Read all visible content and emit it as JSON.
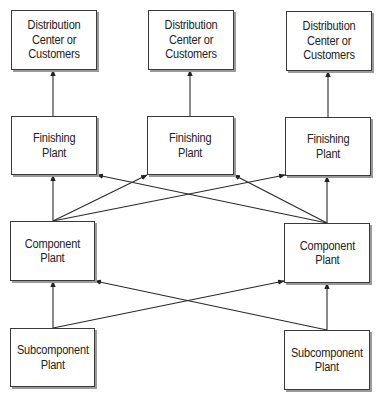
{
  "diagram": {
    "type": "supply-chain-network",
    "nodes": [
      {
        "id": "dc1",
        "label": "Distribution\nCenter or\nCustomers",
        "x": 11,
        "y": 10,
        "w": 86,
        "h": 60
      },
      {
        "id": "dc2",
        "label": "Distribution\nCenter or\nCustomers",
        "x": 148,
        "y": 10,
        "w": 86,
        "h": 60
      },
      {
        "id": "dc3",
        "label": "Distribution\nCenter or\nCustomers",
        "x": 286,
        "y": 11,
        "w": 86,
        "h": 60
      },
      {
        "id": "fp1",
        "label": "Finishing\nPlant",
        "x": 11,
        "y": 116,
        "w": 86,
        "h": 59
      },
      {
        "id": "fp2",
        "label": "Finishing\nPlant",
        "x": 147,
        "y": 116,
        "w": 87,
        "h": 59
      },
      {
        "id": "fp3",
        "label": "Finishing\nPlant",
        "x": 285,
        "y": 117,
        "w": 86,
        "h": 59
      },
      {
        "id": "cp1",
        "label": "Component\nPlant",
        "x": 10,
        "y": 221,
        "w": 85,
        "h": 60
      },
      {
        "id": "cp2",
        "label": "Component\nPlant",
        "x": 284,
        "y": 223,
        "w": 86,
        "h": 60
      },
      {
        "id": "sp1",
        "label": "Subcomponent\nPlant",
        "x": 10,
        "y": 328,
        "w": 85,
        "h": 59
      },
      {
        "id": "sp2",
        "label": "Subcomponent\nPlant",
        "x": 284,
        "y": 330,
        "w": 86,
        "h": 60
      }
    ],
    "edges": [
      {
        "from": "fp1",
        "to": "dc1",
        "x1": 53,
        "y1": 116,
        "x2": 53,
        "y2": 70
      },
      {
        "from": "fp2",
        "to": "dc2",
        "x1": 190,
        "y1": 116,
        "x2": 190,
        "y2": 70
      },
      {
        "from": "fp3",
        "to": "dc3",
        "x1": 328,
        "y1": 117,
        "x2": 328,
        "y2": 71
      },
      {
        "from": "cp1",
        "to": "fp1",
        "x1": 53,
        "y1": 221,
        "x2": 53,
        "y2": 175
      },
      {
        "from": "cp1",
        "to": "fp2",
        "x1": 53,
        "y1": 221,
        "x2": 147,
        "y2": 175
      },
      {
        "from": "cp1",
        "to": "fp3",
        "x1": 53,
        "y1": 221,
        "x2": 285,
        "y2": 175
      },
      {
        "from": "cp2",
        "to": "fp1",
        "x1": 327,
        "y1": 223,
        "x2": 97,
        "y2": 175
      },
      {
        "from": "cp2",
        "to": "fp2",
        "x1": 327,
        "y1": 223,
        "x2": 234,
        "y2": 175
      },
      {
        "from": "cp2",
        "to": "fp3",
        "x1": 327,
        "y1": 223,
        "x2": 327,
        "y2": 176
      },
      {
        "from": "sp1",
        "to": "cp1",
        "x1": 53,
        "y1": 328,
        "x2": 53,
        "y2": 281
      },
      {
        "from": "sp1",
        "to": "cp2",
        "x1": 53,
        "y1": 328,
        "x2": 284,
        "y2": 281
      },
      {
        "from": "sp2",
        "to": "cp1",
        "x1": 327,
        "y1": 330,
        "x2": 95,
        "y2": 281
      },
      {
        "from": "sp2",
        "to": "cp2",
        "x1": 327,
        "y1": 330,
        "x2": 327,
        "y2": 283
      }
    ]
  }
}
